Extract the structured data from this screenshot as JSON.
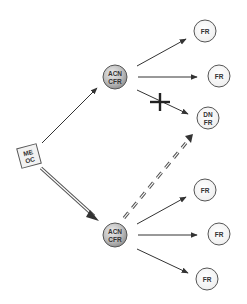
{
  "diagram": {
    "colors": {
      "background": "#ffffff",
      "edge": "#333333",
      "node_stroke": "#555555",
      "hub_fill_light": "#e6e6e6",
      "hub_fill_dark": "#9a9a9a",
      "leaf_fill": "#f4f4f4",
      "source_fill": "#f2f2f2"
    },
    "nodes": {
      "source": {
        "line1": "ME",
        "line2": "OC",
        "shape": "square"
      },
      "hub_top": {
        "line1": "ACN",
        "line2": "CFR",
        "shape": "shaded-circle"
      },
      "hub_bottom": {
        "line1": "ACN",
        "line2": "CFR",
        "shape": "shaded-circle"
      },
      "leaf_1": {
        "line1": "FR",
        "shape": "circle"
      },
      "leaf_2": {
        "line1": "FR",
        "shape": "circle"
      },
      "leaf_dn": {
        "line1": "DN",
        "line2": "FR",
        "shape": "circle"
      },
      "leaf_4": {
        "line1": "FR",
        "shape": "circle"
      },
      "leaf_5": {
        "line1": "FR",
        "shape": "circle"
      },
      "leaf_6": {
        "line1": "FR",
        "shape": "circle"
      }
    },
    "edges": [
      {
        "from": "source",
        "to": "hub_top",
        "style": "solid-arrow"
      },
      {
        "from": "source",
        "to": "hub_bottom",
        "style": "double-line-arrow"
      },
      {
        "from": "hub_top",
        "to": "leaf_1",
        "style": "solid-arrow"
      },
      {
        "from": "hub_top",
        "to": "leaf_2",
        "style": "solid-arrow"
      },
      {
        "from": "hub_top",
        "to": "leaf_dn",
        "style": "solid-arrow-blocked",
        "marker": "cross"
      },
      {
        "from": "hub_bottom",
        "to": "leaf_dn",
        "style": "dashed-double-arrow"
      },
      {
        "from": "hub_bottom",
        "to": "leaf_4",
        "style": "solid-arrow"
      },
      {
        "from": "hub_bottom",
        "to": "leaf_5",
        "style": "solid-arrow"
      },
      {
        "from": "hub_bottom",
        "to": "leaf_6",
        "style": "solid-arrow"
      }
    ]
  }
}
